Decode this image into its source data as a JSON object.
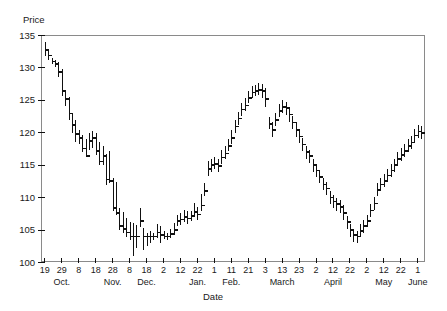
{
  "chart_data": {
    "type": "bar",
    "subtype": "ohlc-range-bars",
    "title": "",
    "xlabel": "Date",
    "ylabel": "Price",
    "ylim": [
      100,
      135
    ],
    "yticks": [
      100,
      105,
      110,
      115,
      120,
      125,
      130,
      135
    ],
    "grid": false,
    "legend": null,
    "xtick_labels": [
      "19",
      "29",
      "8",
      "18",
      "28",
      "8",
      "18",
      "2",
      "12",
      "22",
      "1",
      "11",
      "21",
      "3",
      "13",
      "23",
      "2",
      "12",
      "22",
      "2",
      "12",
      "22",
      "1"
    ],
    "month_labels": [
      "Oct.",
      "Nov.",
      "Dec.",
      "Jan.",
      "Feb.",
      "March",
      "April",
      "May",
      "June"
    ],
    "month_label_positions": [
      1,
      4,
      6,
      9,
      11,
      14,
      17,
      20,
      22
    ],
    "x_index_of_labeled_ticks": [
      0,
      5,
      10,
      15,
      20,
      25,
      30,
      35,
      40,
      45,
      50,
      55,
      60,
      65,
      70,
      75,
      80,
      85,
      90,
      95,
      100,
      105,
      110
    ],
    "n_points": 112,
    "series": [
      {
        "name": "Price",
        "high": [
          134.0,
          132.6,
          131.6,
          131.2,
          130.9,
          129.8,
          126.6,
          125.5,
          123.0,
          121.9,
          120.4,
          119.6,
          119.0,
          119.9,
          120.2,
          120.0,
          118.6,
          117.9,
          116.8,
          117.2,
          113.0,
          112.4,
          108.4,
          107.8,
          106.8,
          106.3,
          106.1,
          105.8,
          108.4,
          105.3,
          104.6,
          104.8,
          104.6,
          106.0,
          105.6,
          104.8,
          104.5,
          105.2,
          106.1,
          107.4,
          107.6,
          108.1,
          108.0,
          108.0,
          109.2,
          108.6,
          110.5,
          112.3,
          115.6,
          116.0,
          116.2,
          115.9,
          117.3,
          118.0,
          119.0,
          120.4,
          122.0,
          123.2,
          124.6,
          125.3,
          126.4,
          127.2,
          127.4,
          127.6,
          127.5,
          126.9,
          122.5,
          121.6,
          123.0,
          124.4,
          125.0,
          124.8,
          124.0,
          122.6,
          121.6,
          120.6,
          119.2,
          118.0,
          117.4,
          116.0,
          115.2,
          114.2,
          113.0,
          112.4,
          111.0,
          110.4,
          110.0,
          109.6,
          108.8,
          107.2,
          106.0,
          105.2,
          104.9,
          105.9,
          106.6,
          107.4,
          109.0,
          110.1,
          112.2,
          113.0,
          113.6,
          114.4,
          115.2,
          116.0,
          117.0,
          117.6,
          118.2,
          119.0,
          119.5,
          120.6,
          121.2,
          121.0
        ],
        "low": [
          131.8,
          131.2,
          130.6,
          130.2,
          128.6,
          125.6,
          124.2,
          122.0,
          120.0,
          118.6,
          118.2,
          117.0,
          116.2,
          117.4,
          117.6,
          116.5,
          115.0,
          115.0,
          112.0,
          112.2,
          108.0,
          107.4,
          105.0,
          104.6,
          104.0,
          103.4,
          101.0,
          102.3,
          105.4,
          102.0,
          102.6,
          103.0,
          103.4,
          103.8,
          103.0,
          103.6,
          103.4,
          103.8,
          104.2,
          105.6,
          105.8,
          106.2,
          106.0,
          106.4,
          107.0,
          106.6,
          108.0,
          110.2,
          113.4,
          114.0,
          114.4,
          114.0,
          115.2,
          116.0,
          117.2,
          118.2,
          120.0,
          121.2,
          122.6,
          123.4,
          124.6,
          125.4,
          125.6,
          125.8,
          125.4,
          124.0,
          120.6,
          119.4,
          121.0,
          122.4,
          123.0,
          122.8,
          121.6,
          120.6,
          119.4,
          118.4,
          117.2,
          116.0,
          115.4,
          114.0,
          113.2,
          112.2,
          111.2,
          110.4,
          109.0,
          108.4,
          108.0,
          107.6,
          106.6,
          105.2,
          104.0,
          103.2,
          103.0,
          103.9,
          104.6,
          105.4,
          107.0,
          108.1,
          110.2,
          111.0,
          111.6,
          112.4,
          113.2,
          114.0,
          115.0,
          115.6,
          116.2,
          117.0,
          117.5,
          118.6,
          119.2,
          119.0
        ],
        "close": [
          132.8,
          131.9,
          131.0,
          130.6,
          129.4,
          126.4,
          125.2,
          123.0,
          121.2,
          119.8,
          119.2,
          117.6,
          116.4,
          118.7,
          119.2,
          117.2,
          115.6,
          116.4,
          112.8,
          112.6,
          108.4,
          107.6,
          105.6,
          105.2,
          104.6,
          104.0,
          104.0,
          104.0,
          106.4,
          104.0,
          104.0,
          104.0,
          104.0,
          104.6,
          104.2,
          104.0,
          104.0,
          104.4,
          105.0,
          106.4,
          106.6,
          107.0,
          106.8,
          107.2,
          107.8,
          107.4,
          108.8,
          111.0,
          114.4,
          115.0,
          115.2,
          114.9,
          116.2,
          116.8,
          118.0,
          119.2,
          121.0,
          122.2,
          123.6,
          124.2,
          125.4,
          126.2,
          126.4,
          126.6,
          126.4,
          125.2,
          121.4,
          120.4,
          122.0,
          123.4,
          124.0,
          123.8,
          122.8,
          121.6,
          120.4,
          119.4,
          118.2,
          117.0,
          116.4,
          115.0,
          114.2,
          113.2,
          112.0,
          111.4,
          110.0,
          109.4,
          109.0,
          108.6,
          107.6,
          106.2,
          105.0,
          104.2,
          104.0,
          104.9,
          105.6,
          106.4,
          108.0,
          109.1,
          111.2,
          112.0,
          112.6,
          113.4,
          114.2,
          115.0,
          116.0,
          116.6,
          117.2,
          118.0,
          118.5,
          119.6,
          120.2,
          120.0
        ]
      }
    ]
  }
}
